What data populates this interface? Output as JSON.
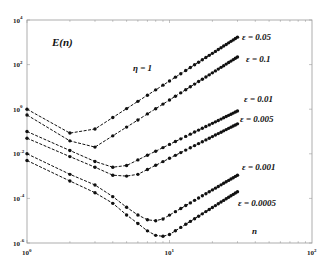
{
  "chart_data": {
    "type": "line",
    "title": "",
    "ylabel": "E(n)",
    "xlabel": "n",
    "annotation": "η = 1",
    "xscale": "log",
    "yscale": "log",
    "xlim": [
      1,
      100
    ],
    "ylim": [
      1e-06,
      10000.0
    ],
    "grid": false,
    "x_ticks": [
      {
        "base": "10",
        "exp": "0"
      },
      {
        "base": "10",
        "exp": "1"
      },
      {
        "base": "10",
        "exp": "2"
      }
    ],
    "y_ticks": [
      {
        "base": "10",
        "exp": "4"
      },
      {
        "base": "10",
        "exp": "2"
      },
      {
        "base": "10",
        "exp": "0"
      },
      {
        "base": "10",
        "exp": "-2"
      },
      {
        "base": "10",
        "exp": "-4"
      },
      {
        "base": "10",
        "exp": "-6"
      }
    ],
    "x_range_points": [
      1,
      30
    ],
    "series": [
      {
        "name": "ε = 0.05",
        "label_pos": [
          242,
          40
        ],
        "keypoints": [
          [
            1,
            1.0
          ],
          [
            2,
            0.085
          ],
          [
            3,
            0.13
          ],
          [
            30,
            1700
          ]
        ]
      },
      {
        "name": "ε = 0.1",
        "label_pos": [
          246,
          62
        ],
        "keypoints": [
          [
            1,
            0.55
          ],
          [
            2,
            0.038
          ],
          [
            3,
            0.02
          ],
          [
            30,
            220
          ]
        ]
      },
      {
        "name": "ε = 0.01",
        "label_pos": [
          244,
          102
        ],
        "keypoints": [
          [
            1,
            0.1
          ],
          [
            2,
            0.014
          ],
          [
            3,
            0.0045
          ],
          [
            4,
            0.0025
          ],
          [
            5,
            0.003
          ],
          [
            30,
            0.83
          ]
        ]
      },
      {
        "name": "ε = 0.005",
        "label_pos": [
          240,
          122
        ],
        "keypoints": [
          [
            1,
            0.05
          ],
          [
            2,
            0.0075
          ],
          [
            3,
            0.0025
          ],
          [
            4,
            0.0011
          ],
          [
            5,
            0.001
          ],
          [
            6,
            0.0012
          ],
          [
            30,
            0.22
          ]
        ]
      },
      {
        "name": "ε = 0.001",
        "label_pos": [
          242,
          170
        ],
        "keypoints": [
          [
            1,
            0.01
          ],
          [
            2,
            0.0012
          ],
          [
            3,
            0.0004
          ],
          [
            4,
            0.00012
          ],
          [
            5,
            4e-05
          ],
          [
            6,
            1.8e-05
          ],
          [
            7,
            1.1e-05
          ],
          [
            8,
            1e-05
          ],
          [
            9,
            1.2e-05
          ],
          [
            30,
            0.0011
          ]
        ]
      },
      {
        "name": "ε = 0.0005",
        "label_pos": [
          238,
          206
        ],
        "keypoints": [
          [
            1,
            0.005
          ],
          [
            2,
            0.0006
          ],
          [
            3,
            0.00018
          ],
          [
            4,
            6e-05
          ],
          [
            5,
            1.8e-05
          ],
          [
            6,
            7.5e-06
          ],
          [
            7,
            3.5e-06
          ],
          [
            8,
            2.2e-06
          ],
          [
            9,
            2e-06
          ],
          [
            10,
            2.4e-06
          ],
          [
            30,
            0.0002
          ]
        ]
      }
    ]
  },
  "annotations": {
    "ylabel": "E(n)",
    "eta": "η = 1",
    "xlabel": "n"
  }
}
